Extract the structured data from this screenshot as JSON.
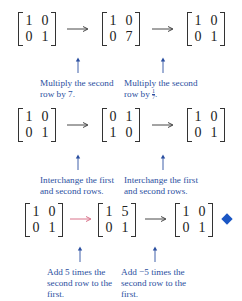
{
  "colors": {
    "annotation_text": "#2b4fa0",
    "highlight_arrow": "#d9728a",
    "diamond": "#1a56c4"
  },
  "rows": [
    {
      "matrices": [
        [
          [
            "1",
            "0"
          ],
          [
            "0",
            "1"
          ]
        ],
        [
          [
            "1",
            "0"
          ],
          [
            "0",
            "7"
          ]
        ],
        [
          [
            "1",
            "0"
          ],
          [
            "0",
            "1"
          ]
        ]
      ],
      "notes": [
        {
          "text": "Multiply the second row by 7."
        },
        {
          "text_prefix": "Multiply the second row by ",
          "frac_num": "1",
          "frac_den": "7",
          "text_suffix": "."
        }
      ]
    },
    {
      "matrices": [
        [
          [
            "1",
            "0"
          ],
          [
            "0",
            "1"
          ]
        ],
        [
          [
            "0",
            "1"
          ],
          [
            "1",
            "0"
          ]
        ],
        [
          [
            "1",
            "0"
          ],
          [
            "0",
            "1"
          ]
        ]
      ],
      "notes": [
        {
          "text": "Interchange the first and second rows."
        },
        {
          "text": "Interchange the first and second rows."
        }
      ]
    },
    {
      "matrices": [
        [
          [
            "1",
            "0"
          ],
          [
            "0",
            "1"
          ]
        ],
        [
          [
            "1",
            "5"
          ],
          [
            "0",
            "1"
          ]
        ],
        [
          [
            "1",
            "0"
          ],
          [
            "0",
            "1"
          ]
        ]
      ],
      "notes": [
        {
          "text": "Add 5 times the second row to the first."
        },
        {
          "text": "Add −5 times the second row to the first."
        }
      ],
      "end_marker": "diamond"
    }
  ]
}
